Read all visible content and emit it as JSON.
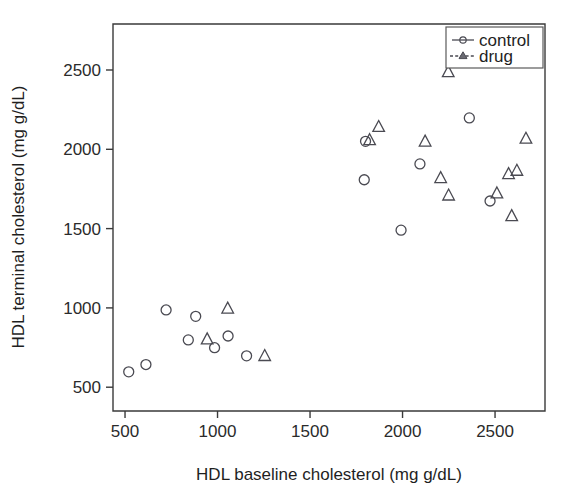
{
  "chart_data": {
    "type": "scatter",
    "title": "",
    "xlabel": "HDL baseline cholesterol (mg g/dL)",
    "ylabel": "HDL terminal cholesterol (mg g/dL)",
    "xlim": [
      435,
      2770
    ],
    "ylim": [
      350,
      2790
    ],
    "xticks": [
      500,
      1000,
      1500,
      2000,
      2500
    ],
    "xtick_labels": [
      "500",
      "1000",
      "1500",
      "2000",
      "2500"
    ],
    "yticks": [
      500,
      1000,
      1500,
      2000,
      2500
    ],
    "ytick_labels": [
      "500",
      "1000",
      "1500",
      "2000",
      "2500"
    ],
    "grid": false,
    "legend_position": "top-right",
    "series": [
      {
        "name": "control",
        "marker": "circle",
        "line_style": "solid",
        "points": [
          {
            "x": 520,
            "y": 597
          },
          {
            "x": 613,
            "y": 643
          },
          {
            "x": 722,
            "y": 987
          },
          {
            "x": 882,
            "y": 947
          },
          {
            "x": 842,
            "y": 798
          },
          {
            "x": 1057,
            "y": 823
          },
          {
            "x": 984,
            "y": 749
          },
          {
            "x": 1157,
            "y": 698
          },
          {
            "x": 1800,
            "y": 2050
          },
          {
            "x": 1793,
            "y": 1808
          },
          {
            "x": 1992,
            "y": 1490
          },
          {
            "x": 2094,
            "y": 1908
          },
          {
            "x": 2361,
            "y": 2198
          },
          {
            "x": 2473,
            "y": 1674
          }
        ]
      },
      {
        "name": "drug",
        "marker": "triangle",
        "line_style": "dashed",
        "points": [
          {
            "x": 1055,
            "y": 997
          },
          {
            "x": 944,
            "y": 803
          },
          {
            "x": 1255,
            "y": 698
          },
          {
            "x": 1822,
            "y": 2059
          },
          {
            "x": 1871,
            "y": 2142
          },
          {
            "x": 2122,
            "y": 2050
          },
          {
            "x": 2206,
            "y": 1820
          },
          {
            "x": 2247,
            "y": 2488
          },
          {
            "x": 2249,
            "y": 1710
          },
          {
            "x": 2510,
            "y": 1723
          },
          {
            "x": 2573,
            "y": 1845
          },
          {
            "x": 2618,
            "y": 1866
          },
          {
            "x": 2590,
            "y": 1580
          },
          {
            "x": 2667,
            "y": 2068
          }
        ]
      }
    ]
  },
  "legend": {
    "entries": [
      {
        "label": "control"
      },
      {
        "label": "drug"
      }
    ]
  },
  "icons": {
    "circle_marker": "circle-marker-icon",
    "triangle_marker": "triangle-marker-icon"
  }
}
